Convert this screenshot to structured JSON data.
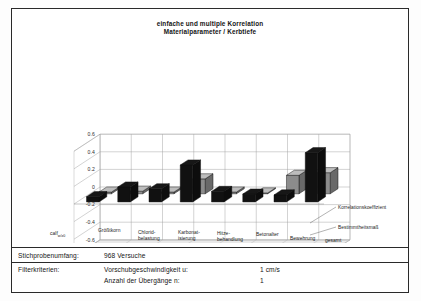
{
  "chart_data": {
    "type": "bar",
    "title": "einfache und multiple Korrelation\nMaterialparameter / Kerbtiefe",
    "title_line1": "einfache und multiple Korrelation",
    "title_line2": "Materialparameter / Kerbtiefe",
    "xlabel": "",
    "ylabel": "",
    "ylim": [
      -0.6,
      0.6
    ],
    "yticks": [
      "0.6",
      "0.4",
      "0.2",
      "0",
      "-0.2",
      "-0.4",
      "-0.6"
    ],
    "ytick_values": [
      0.6,
      0.4,
      0.2,
      0,
      -0.2,
      -0.4,
      -0.6
    ],
    "grid": true,
    "legend_position": "right",
    "projection": "3d",
    "categories": [
      "calf w/z0",
      "Größtkorn",
      "Chlorid-belastung",
      "Karbonat-isierung",
      "Hitze-behandlung",
      "Betonalter",
      "Bewehrung",
      "gesamt"
    ],
    "category_lines": [
      [
        "calf",
        "w/z0",
        ""
      ],
      [
        "Größtkorn",
        "",
        ""
      ],
      [
        "Chlorid-",
        "belastung",
        ""
      ],
      [
        "Karbonat-",
        "isierung",
        ""
      ],
      [
        "Hitze-",
        "behandlung",
        ""
      ],
      [
        "Betonalter",
        "",
        ""
      ],
      [
        "Bewehrung",
        "",
        ""
      ],
      [
        "gesamt",
        "",
        ""
      ]
    ],
    "series": [
      {
        "name": "Korrelationskoeffizient",
        "color": "#111111",
        "values": [
          0.06,
          0.17,
          0.15,
          0.42,
          0.12,
          0.09,
          0.08,
          0.56
        ]
      },
      {
        "name": "Bestimmtheitsmaß",
        "color": "#8c8c8c",
        "values": [
          0.02,
          0.03,
          0.02,
          0.17,
          0.02,
          0.01,
          0.21,
          0.24
        ]
      }
    ]
  },
  "legend": {
    "items": [
      {
        "label": "Korrelationskoeffizient"
      },
      {
        "label": "Bestimmtheitsmaß"
      }
    ]
  },
  "table": {
    "row1": {
      "label": "Stichprobenumfang:",
      "value": "968 Versuche"
    },
    "row2": {
      "label": "Filterkriterien:",
      "lines": [
        {
          "criterion": "Vorschubgeschwindigkeit u:",
          "value": "1 cm/s"
        },
        {
          "criterion": "Anzahl der Übergänge n:",
          "value": "1"
        }
      ]
    }
  }
}
